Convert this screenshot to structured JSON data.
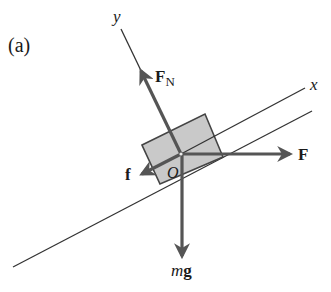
{
  "figure": {
    "panel_label": "(a)",
    "axes": {
      "x_label": "x",
      "y_label": "y",
      "origin_label": "O"
    },
    "forces": {
      "normal": {
        "symbol": "F",
        "subscript": "N"
      },
      "applied": {
        "symbol": "F"
      },
      "friction": {
        "symbol": "f"
      },
      "weight": {
        "mass": "m",
        "accel": "g"
      }
    },
    "colors": {
      "arrow": "#555555",
      "line": "#333333",
      "block_fill": "#c8c8c8",
      "block_stroke": "#444444"
    }
  }
}
